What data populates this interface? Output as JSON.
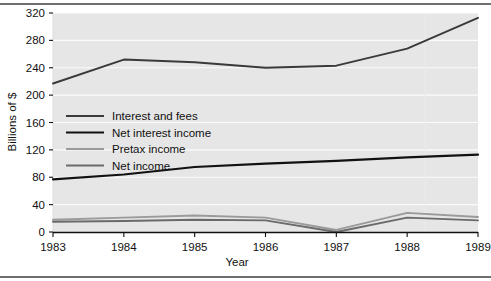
{
  "chart_data": {
    "type": "line",
    "title": "",
    "xlabel": "Year",
    "ylabel": "Billions of $",
    "x": [
      1983,
      1984,
      1985,
      1986,
      1987,
      1988,
      1989
    ],
    "categories": [
      "1983",
      "1984",
      "1985",
      "1986",
      "1987",
      "1988",
      "1989"
    ],
    "xlim": [
      1983,
      1989
    ],
    "ylim": [
      0,
      320
    ],
    "xticks": [
      "1983",
      "1984",
      "1985",
      "1986",
      "1987",
      "1988",
      "1989"
    ],
    "yticks": [
      "0",
      "40",
      "80",
      "120",
      "160",
      "200",
      "240",
      "280",
      "320"
    ],
    "grid": "horizontal-white",
    "legend_position": "inside-upper-left",
    "plot_background": "#e6e6e6",
    "series": [
      {
        "name": "Interest and fees",
        "color": "#3a3a3a",
        "width": 1.9,
        "values": [
          217,
          252,
          248,
          240,
          243,
          268,
          313
        ]
      },
      {
        "name": "Net interest income",
        "color": "#111111",
        "width": 2.2,
        "values": [
          77,
          84,
          95,
          100,
          104,
          109,
          113
        ]
      },
      {
        "name": "Pretax income",
        "color": "#9a9a9a",
        "width": 1.9,
        "values": [
          18,
          21,
          24,
          21,
          3,
          28,
          22
        ]
      },
      {
        "name": "Net income",
        "color": "#6a6a6a",
        "width": 1.9,
        "values": [
          15,
          16,
          18,
          17,
          0,
          21,
          17
        ]
      }
    ]
  },
  "legend": {
    "entries": [
      {
        "label": "Interest and fees"
      },
      {
        "label": "Net interest income"
      },
      {
        "label": "Pretax income"
      },
      {
        "label": "Net income"
      }
    ]
  }
}
